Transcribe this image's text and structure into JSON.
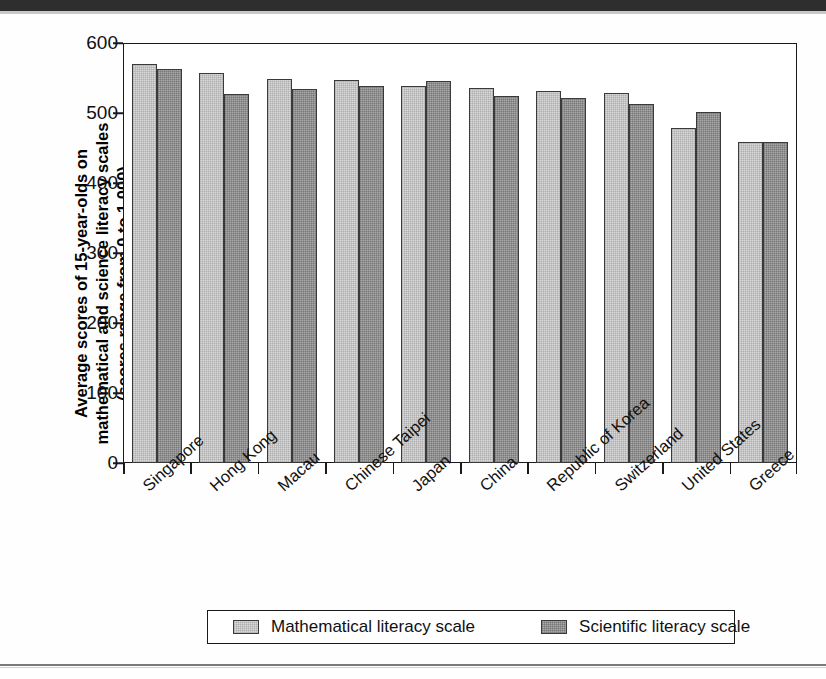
{
  "chart_data": {
    "type": "bar",
    "title": "",
    "xlabel": "",
    "ylabel": "Average scores of 15-year-olds on mathematical and science literacy scales (scores range from 0 to 1,000)",
    "ylabel_lines": [
      "Average scores of 15-year-olds on",
      "mathematical and science literacy scales",
      "(scores range from 0 to 1,000)"
    ],
    "ylim": [
      0,
      600
    ],
    "yticks": [
      0,
      100,
      200,
      300,
      400,
      500,
      600
    ],
    "ytick_labels": [
      "0",
      "100",
      "200",
      "300",
      "400",
      "500",
      "600"
    ],
    "grid": false,
    "legend_position": "bottom",
    "categories": [
      "Singapore",
      "Hong Kong",
      "Macau",
      "Chinese Taipei",
      "Japan",
      "China",
      "Republic of Korea",
      "Switzerland",
      "United States",
      "Greece"
    ],
    "series": [
      {
        "name": "Mathematical  literacy scale",
        "color": "#d9d9d9",
        "values": [
          570,
          557,
          548,
          547,
          539,
          536,
          532,
          529,
          479,
          459
        ]
      },
      {
        "name": "Scientific literacy scale",
        "color": "#a9a9a9",
        "values": [
          563,
          527,
          535,
          539,
          546,
          525,
          522,
          513,
          502,
          459
        ]
      }
    ]
  },
  "legend": {
    "entries": [
      {
        "label": "Mathematical  literacy scale"
      },
      {
        "label": "Scientific literacy scale"
      }
    ]
  }
}
